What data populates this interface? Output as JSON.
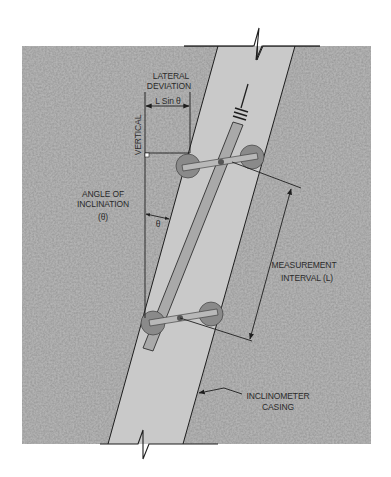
{
  "diagram": {
    "type": "inclinometer-measurement-schematic",
    "labels": {
      "lateral_deviation_line1": "LATERAL",
      "lateral_deviation_line2": "DEVIATION",
      "lateral_formula": "L Sin θ",
      "vertical": "VERTICAL",
      "angle_line1": "ANGLE OF",
      "angle_line2": "INCLINATION",
      "angle_line3": "(θ)",
      "theta": "θ",
      "interval_line1": "MEASUREMENT",
      "interval_line2": "INTERVAL (L)",
      "casing_line1": "INCLINOMETER",
      "casing_line2": "CASING"
    },
    "colors": {
      "soil": "#b4b4b4",
      "casing": "#c8c8c8",
      "probe": "#a9a9a9",
      "wheel": "#8a8a8a",
      "line": "#1e1e1e",
      "text": "#2a2a2a"
    }
  }
}
